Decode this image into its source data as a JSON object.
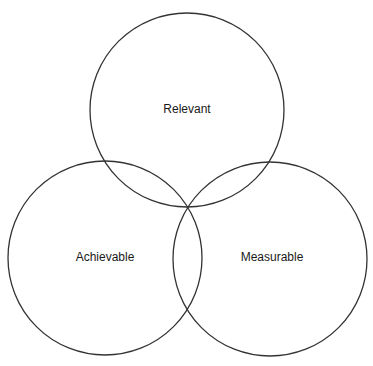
{
  "diagram": {
    "type": "venn",
    "stroke_color": "#333333",
    "circles": [
      {
        "label": "Relevant",
        "cx": 187,
        "cy": 110,
        "r": 97
      },
      {
        "label": "Achievable",
        "cx": 105,
        "cy": 258,
        "r": 97
      },
      {
        "label": "Measurable",
        "cx": 270,
        "cy": 259,
        "r": 97
      }
    ]
  }
}
